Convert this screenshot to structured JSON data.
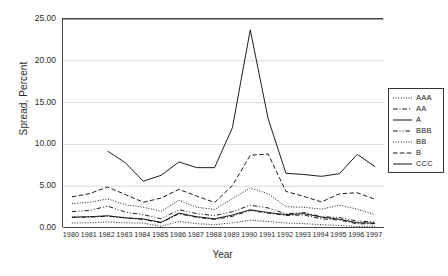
{
  "page": {
    "clipped_top_text": ""
  },
  "axes": {
    "ylabel": "Spread, Percent",
    "xlabel": "Year",
    "yticks": [
      "0.00",
      "5.00",
      "10.00",
      "15.00",
      "20.00",
      "25.00"
    ]
  },
  "legend": {
    "position": "right",
    "items": [
      {
        "label": "AAA",
        "style": "dotted"
      },
      {
        "label": "AA",
        "style": "dashdot"
      },
      {
        "label": "A",
        "style": "solid"
      },
      {
        "label": "BBB",
        "style": "dashdotdot"
      },
      {
        "label": "BB",
        "style": "dotted"
      },
      {
        "label": "B",
        "style": "dashed"
      },
      {
        "label": "CCC",
        "style": "solid"
      }
    ]
  },
  "chart_data": {
    "type": "line",
    "title": "",
    "xlabel": "Year",
    "ylabel": "Spread, Percent",
    "xlim": [
      1980,
      1997
    ],
    "ylim": [
      0,
      25
    ],
    "ytick_step": 5,
    "grid": true,
    "grid_axis": "y",
    "legend_position": "right",
    "categories": [
      1980,
      1981,
      1982,
      1983,
      1984,
      1985,
      1986,
      1987,
      1988,
      1989,
      1990,
      1991,
      1992,
      1993,
      1994,
      1995,
      1996,
      1997
    ],
    "series": [
      {
        "name": "AAA",
        "style": "dotted",
        "values": [
          0.6,
          0.62,
          0.72,
          0.62,
          0.58,
          0.2,
          0.78,
          0.52,
          0.4,
          0.62,
          0.92,
          0.78,
          0.6,
          0.52,
          0.4,
          0.3,
          0.18,
          0.22
        ]
      },
      {
        "name": "AA",
        "style": "dashdot",
        "values": [
          1.28,
          1.3,
          1.42,
          1.2,
          1.02,
          0.62,
          1.7,
          1.28,
          1.02,
          1.4,
          2.1,
          1.78,
          1.5,
          1.55,
          1.1,
          0.95,
          0.5,
          0.52
        ]
      },
      {
        "name": "A",
        "style": "solid",
        "values": [
          1.3,
          1.35,
          1.46,
          1.22,
          1.08,
          0.68,
          1.78,
          1.35,
          1.1,
          1.55,
          2.18,
          1.85,
          1.6,
          1.72,
          1.3,
          1.05,
          0.62,
          0.6
        ]
      },
      {
        "name": "BBB",
        "style": "dashdotdot",
        "values": [
          1.95,
          2.1,
          2.62,
          1.9,
          1.6,
          1.1,
          2.18,
          1.72,
          1.48,
          1.95,
          2.72,
          2.4,
          1.7,
          1.85,
          1.35,
          1.25,
          0.82,
          0.72
        ]
      },
      {
        "name": "BB",
        "style": "dotted",
        "values": [
          2.92,
          3.08,
          3.48,
          2.78,
          2.48,
          2.0,
          3.32,
          2.48,
          2.22,
          3.52,
          4.78,
          4.1,
          2.55,
          2.48,
          2.25,
          2.72,
          2.25,
          1.6
        ]
      },
      {
        "name": "B",
        "style": "dashed",
        "values": [
          3.72,
          4.12,
          4.9,
          4.0,
          3.08,
          3.58,
          4.62,
          3.82,
          3.05,
          5.08,
          8.7,
          8.85,
          4.38,
          3.78,
          3.12,
          4.1,
          4.22,
          3.42
        ]
      },
      {
        "name": "CCC",
        "style": "solid",
        "values": [
          null,
          null,
          9.2,
          7.8,
          5.6,
          6.3,
          7.9,
          7.22,
          7.22,
          12.0,
          23.7,
          13.1,
          6.55,
          6.4,
          6.18,
          6.5,
          8.8,
          7.35
        ]
      }
    ]
  }
}
